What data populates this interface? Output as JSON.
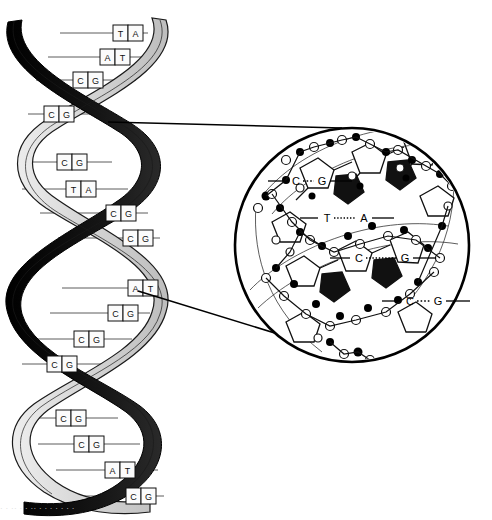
{
  "figure": {
    "background_color": "#ffffff",
    "ink_color": "#000000",
    "ribbon_light_color": "#d9d9d9",
    "ribbon_dark_color": "#111111"
  },
  "helix": {
    "label": "DNA double helix",
    "strand_a_name": "light-ribbon-strand",
    "strand_b_name": "dark-ribbon-strand",
    "rung_label": "base-pair-rung",
    "base_pairs": [
      {
        "left": "T",
        "right": "A",
        "y": 33
      },
      {
        "left": "A",
        "right": "T",
        "y": 57
      },
      {
        "left": "C",
        "right": "G",
        "y": 80
      },
      {
        "left": "C",
        "right": "G",
        "y": 114
      },
      {
        "left": "C",
        "right": "G",
        "y": 162
      },
      {
        "left": "T",
        "right": "A",
        "y": 189
      },
      {
        "left": "C",
        "right": "G",
        "y": 213
      },
      {
        "left": "C",
        "right": "G",
        "y": 238
      },
      {
        "left": "A",
        "right": "T",
        "y": 288
      },
      {
        "left": "C",
        "right": "G",
        "y": 313
      },
      {
        "left": "C",
        "right": "G",
        "y": 339
      },
      {
        "left": "C",
        "right": "G",
        "y": 364
      },
      {
        "left": "C",
        "right": "G",
        "y": 418
      },
      {
        "left": "C",
        "right": "G",
        "y": 444
      },
      {
        "left": "A",
        "right": "T",
        "y": 470
      },
      {
        "left": "C",
        "right": "G",
        "y": 496
      }
    ]
  },
  "inset": {
    "label": "magnified-base-pair-detail",
    "circle": {
      "cx": 352,
      "cy": 245,
      "r": 117
    },
    "atom_filled_color": "#000000",
    "atom_open_color": "#ffffff",
    "base_pairs": [
      {
        "left": "C",
        "right": "G",
        "bond_style": "short-dotted",
        "x_left": 296,
        "x_right": 320,
        "y": 181
      },
      {
        "left": "T",
        "right": "A",
        "bond_style": "long-dotted",
        "x_left": 326,
        "x_right": 364,
        "y": 218
      },
      {
        "left": "C",
        "right": "G",
        "bond_style": "long-dotted",
        "x_left": 358,
        "x_right": 404,
        "y": 258
      },
      {
        "left": "C",
        "right": "G",
        "bond_style": "short-dotted",
        "x_left": 409,
        "x_right": 437,
        "y": 301
      }
    ]
  },
  "leaders": {
    "upper_label": "upper-leader-line",
    "lower_label": "lower-leader-line"
  },
  "caption": {
    "ghost_text": "·  ·   ·· ·  ·  ·· ·  ·  · ·  ·   · ·"
  }
}
